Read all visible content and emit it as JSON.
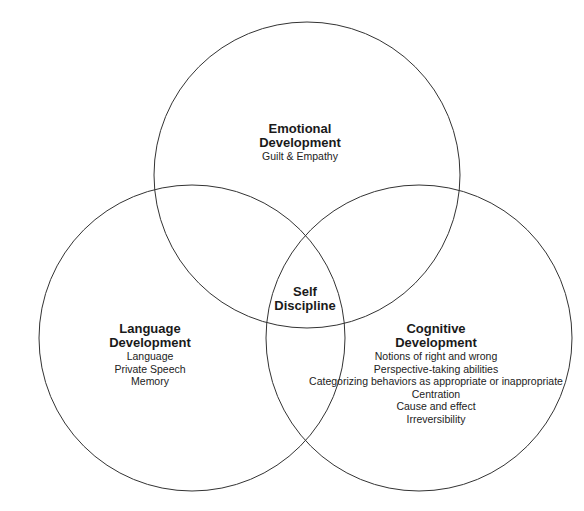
{
  "diagram": {
    "type": "venn",
    "line_color": "#333333",
    "background": "#ffffff",
    "circles": [
      {
        "id": "emotional",
        "cx": 307,
        "cy": 175,
        "r": 153
      },
      {
        "id": "language",
        "cx": 192,
        "cy": 338,
        "r": 153
      },
      {
        "id": "cognitive",
        "cx": 419,
        "cy": 338,
        "r": 153
      }
    ],
    "center": {
      "title_line1": "Self",
      "title_line2": "Discipline"
    },
    "emotional": {
      "title_line1": "Emotional",
      "title_line2": "Development",
      "items": [
        "Guilt & Empathy"
      ]
    },
    "language": {
      "title_line1": "Language",
      "title_line2": "Development",
      "items": [
        "Language",
        "Private Speech",
        "Memory"
      ]
    },
    "cognitive": {
      "title_line1": "Cognitive",
      "title_line2": "Development",
      "items": [
        "Notions of right and wrong",
        "Perspective-taking abilities",
        "Categorizing behaviors as appropriate or inappropriate",
        "Centration",
        "Cause and effect",
        "Irreversibility"
      ]
    }
  }
}
